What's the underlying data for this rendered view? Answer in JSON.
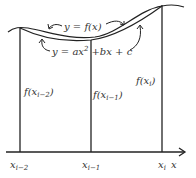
{
  "diagram": {
    "curve_labels": {
      "true_function": "y = f(x)",
      "parabola_part1": "y = ax",
      "parabola_exp": "2",
      "parabola_part2": "+bx + c"
    },
    "ordinates": [
      {
        "label": "f(x",
        "sub": "i−2",
        "close": ")"
      },
      {
        "label": "f(x",
        "sub": "i−1",
        "close": ")"
      },
      {
        "label": "f(x",
        "sub": "i",
        "close": ")"
      }
    ],
    "axis_ticks": [
      {
        "label": "x",
        "sub": "i−2"
      },
      {
        "label": "x",
        "sub": "i−1"
      },
      {
        "label": "x",
        "sub": "i"
      }
    ],
    "axis_label": "x",
    "colors": {
      "line": "#222222",
      "background": "#ffffff"
    }
  }
}
